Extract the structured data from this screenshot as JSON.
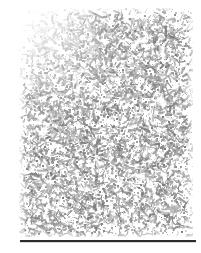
{
  "figure": {
    "kind": "scanned-grayscale-texture-plate",
    "canvas_width": 201,
    "canvas_height": 253,
    "page_background": "#ffffff"
  },
  "texture_plate": {
    "label": "random speckle texture",
    "left": 19,
    "top": 8,
    "width": 174,
    "height": 229,
    "ink_color": "#9a9a9a",
    "ink_color_dark": "#7d7d7d",
    "ink_color_light": "#bcbcbc",
    "background": "#ffffff",
    "coverage_percent": 34,
    "grain_seed": 20873,
    "grain_min_px": 1,
    "grain_max_px": 4,
    "density_gradient": "lighter at top-left, denser toward bottom-left and center"
  },
  "bottom_rule": {
    "label": "horizontal rule",
    "left": 20,
    "top": 240,
    "width": 176,
    "height": 2,
    "color": "#2b2b2b"
  },
  "bottom_rule_shadow": {
    "left": 20,
    "top": 242,
    "width": 176,
    "height": 1,
    "color": "rgba(120,120,120,0.30)"
  }
}
